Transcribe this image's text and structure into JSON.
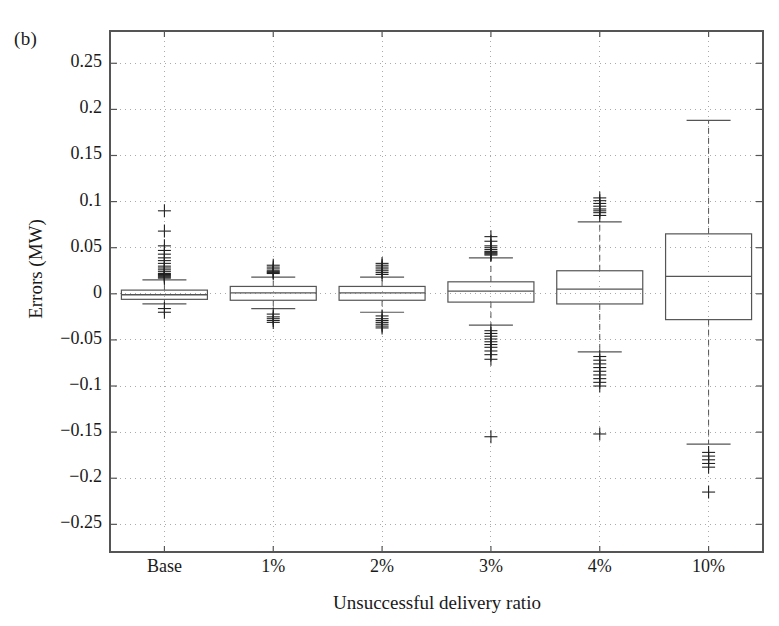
{
  "figure": {
    "panel_label": "(b)",
    "ylabel": "Errors (MW)",
    "xlabel": "Unsuccessful delivery ratio"
  },
  "axes": {
    "ytick_labels": [
      "0.25",
      "0.2",
      "0.15",
      "0.1",
      "0.05",
      "0",
      "-0.05",
      "-0.1",
      "-0.15",
      "-0.2",
      "-0.25"
    ],
    "xtick_labels": [
      "Base",
      "1%",
      "2%",
      "3%",
      "4%",
      "10%"
    ],
    "grid": "dotted",
    "line_color": "#555555",
    "grid_color": "#aaaaaa"
  },
  "chart_data": {
    "type": "box",
    "title": "",
    "xlabel": "Unsuccessful delivery ratio",
    "ylabel": "Errors (MW)",
    "categories": [
      "Base",
      "1%",
      "2%",
      "3%",
      "4%",
      "10%"
    ],
    "ylim": [
      -0.28,
      0.285
    ],
    "yticks": [
      0.25,
      0.2,
      0.15,
      0.1,
      0.05,
      0,
      -0.05,
      -0.1,
      -0.15,
      -0.2,
      -0.25
    ],
    "grid": true,
    "legend": "none",
    "boxes": [
      {
        "category": "Base",
        "q1": -0.006,
        "median": -0.001,
        "q3": 0.004,
        "whisker_low": -0.011,
        "whisker_high": 0.015,
        "outliers": [
          0.09,
          0.068,
          0.052,
          0.047,
          0.043,
          0.039,
          0.036,
          0.033,
          0.03,
          0.028,
          0.026,
          0.024,
          0.022,
          0.021,
          0.02,
          0.019,
          0.018,
          0.017,
          -0.016,
          -0.02
        ]
      },
      {
        "category": "1%",
        "q1": -0.007,
        "median": 0.001,
        "q3": 0.008,
        "whisker_low": -0.016,
        "whisker_high": 0.018,
        "outliers": [
          0.031,
          0.029,
          0.027,
          0.025,
          0.024,
          0.023,
          0.022,
          -0.022,
          -0.025,
          -0.027,
          -0.029,
          -0.031
        ]
      },
      {
        "category": "2%",
        "q1": -0.007,
        "median": 0.001,
        "q3": 0.008,
        "whisker_low": -0.02,
        "whisker_high": 0.018,
        "outliers": [
          0.033,
          0.031,
          0.029,
          0.027,
          0.025,
          0.023,
          0.021,
          -0.024,
          -0.027,
          -0.029,
          -0.031,
          -0.033,
          -0.035,
          -0.037
        ]
      },
      {
        "category": "3%",
        "q1": -0.009,
        "median": 0.003,
        "q3": 0.013,
        "whisker_low": -0.034,
        "whisker_high": 0.039,
        "outliers": [
          0.062,
          0.057,
          0.052,
          0.05,
          0.048,
          0.046,
          0.045,
          0.044,
          0.043,
          0.042,
          -0.04,
          -0.043,
          -0.046,
          -0.049,
          -0.052,
          -0.055,
          -0.058,
          -0.062,
          -0.066,
          -0.071,
          -0.155
        ]
      },
      {
        "category": "4%",
        "q1": -0.011,
        "median": 0.005,
        "q3": 0.025,
        "whisker_low": -0.063,
        "whisker_high": 0.078,
        "outliers": [
          0.104,
          0.101,
          0.098,
          0.095,
          0.092,
          0.09,
          0.088,
          0.085,
          -0.068,
          -0.072,
          -0.076,
          -0.08,
          -0.084,
          -0.088,
          -0.092,
          -0.096,
          -0.1,
          -0.152
        ]
      },
      {
        "category": "10%",
        "q1": -0.028,
        "median": 0.019,
        "q3": 0.065,
        "whisker_low": -0.163,
        "whisker_high": 0.188,
        "outliers": [
          -0.172,
          -0.176,
          -0.18,
          -0.184,
          -0.188,
          -0.215
        ]
      }
    ]
  }
}
